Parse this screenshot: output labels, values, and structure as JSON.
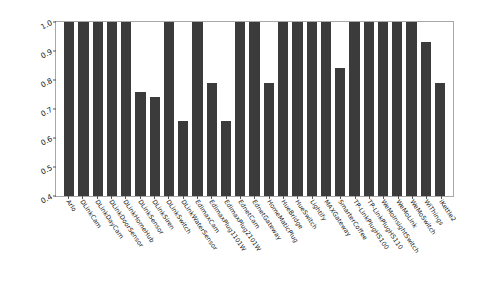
{
  "chart_data": {
    "type": "bar",
    "title": "",
    "xlabel": "",
    "ylabel": "F1-Score",
    "ylim": [
      0.4,
      1.0
    ],
    "yticks": [
      "0.4",
      "0.5",
      "0.6",
      "0.7",
      "0.8",
      "0.9",
      "1.0"
    ],
    "grid": false,
    "legend": null,
    "bar_color": "#3b3b3b",
    "categories": [
      "Arlo",
      "DLinkCam",
      "DLinkDayCam",
      "DLinkDoorSensor",
      "DLinkHomeHub",
      "DLinkSensor",
      "DLinkSiren",
      "DLinkSwitch",
      "DLinkWaterSensor",
      "EdimaxCam",
      "EdimaxPlug1101W",
      "EdimaxPlug2101W",
      "EdnetCam",
      "EdnetGateway",
      "HomeMaticPlug",
      "HueBridge",
      "HueSwitch",
      "Lightify",
      "MAXGateway",
      "SmarterCoffee",
      "TP-LinkPlugHS100",
      "TP-LinkPlugHS110",
      "WeMoInsightSwitch",
      "WeMoLink",
      "WeMoSwitch",
      "WiThings",
      "iKettle2"
    ],
    "values": [
      1.0,
      1.0,
      1.0,
      1.0,
      1.0,
      0.76,
      0.74,
      1.0,
      0.66,
      1.0,
      0.79,
      0.66,
      1.0,
      1.0,
      0.79,
      1.0,
      1.0,
      1.0,
      1.0,
      0.84,
      1.0,
      1.0,
      1.0,
      1.0,
      1.0,
      0.93,
      0.79
    ]
  }
}
